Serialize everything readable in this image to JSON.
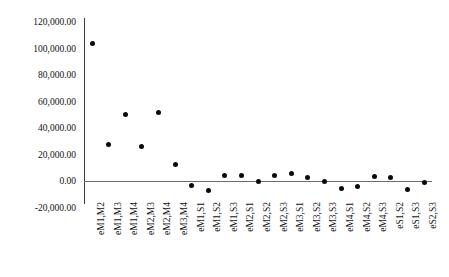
{
  "chart_data": {
    "type": "scatter",
    "title": "",
    "xlabel": "",
    "ylabel": "",
    "grid": false,
    "legend": false,
    "ylim": [
      -20000,
      120000
    ],
    "ytick_step": 20000,
    "yticks": [
      "120,000.00",
      "100,000.00",
      "80,000.00",
      "60,000.00",
      "40,000.00",
      "20,000.00",
      "0.00",
      "-20,000.00"
    ],
    "ytick_values": [
      120000,
      100000,
      80000,
      60000,
      40000,
      20000,
      0,
      -20000
    ],
    "categories": [
      "eM1,M2",
      "eM1,M3",
      "eM1,M4",
      "eM2,M3",
      "eM2,M4",
      "eM3,M4",
      "eM1,S1",
      "eM1,S2",
      "eM1,S3",
      "eM2,S1",
      "eM2,S2",
      "eM2,S3",
      "eM3,S1",
      "eM3,S2",
      "eM3,S3",
      "eM4,S1",
      "eM4,S2",
      "eM4,S3",
      "eS1,S2",
      "eS1,S3",
      "eS2,S3"
    ],
    "values": [
      104000,
      27500,
      50500,
      26000,
      51500,
      12500,
      -3500,
      -7500,
      4000,
      4000,
      -500,
      4500,
      6000,
      2500,
      -500,
      -6000,
      -4000,
      3500,
      3000,
      -6500,
      -1000
    ],
    "series_name": "residuals",
    "marker": "filled-circle",
    "marker_color": "#0a0a0a"
  },
  "axis": {
    "zero_line_color": "#6b6b6b",
    "spine_color": "#3a3a3a"
  }
}
